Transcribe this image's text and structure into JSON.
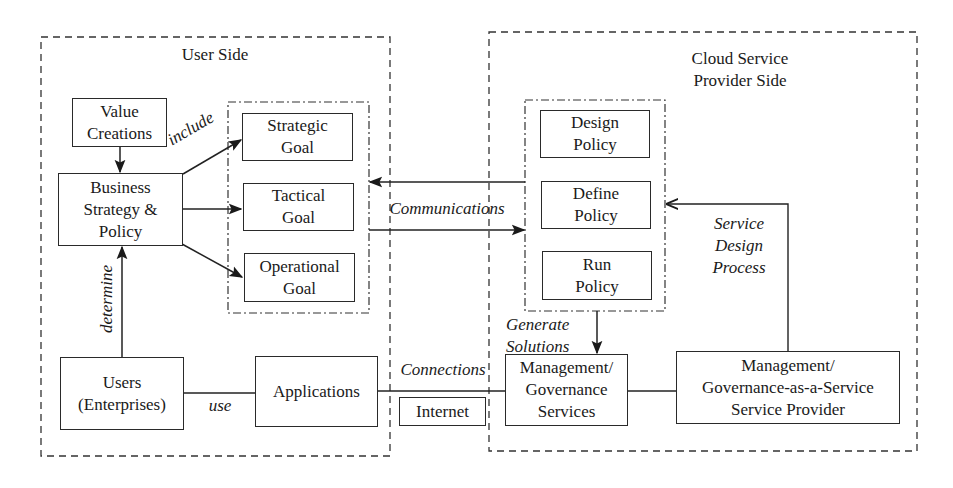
{
  "regions": {
    "user_side": {
      "title": "User Side"
    },
    "cloud_side": {
      "title": "Cloud Service\nProvider Side"
    }
  },
  "nodes": {
    "value_creations": "Value\nCreations",
    "business_strategy": "Business\nStrategy &\nPolicy",
    "strategic_goal": "Strategic\nGoal",
    "tactical_goal": "Tactical\nGoal",
    "operational_goal": "Operational\nGoal",
    "users": "Users\n(Enterprises)",
    "applications": "Applications",
    "internet": "Internet",
    "design_policy": "Design\nPolicy",
    "define_policy": "Define\nPolicy",
    "run_policy": "Run\nPolicy",
    "mgmt_services": "Management/\nGovernance\nServices",
    "mgaas_provider": "Management/\nGovernance-as-a-Service\nService Provider"
  },
  "edge_labels": {
    "include": "include",
    "determine": "determine",
    "use": "use",
    "communications": "Communications",
    "connections": "Connections",
    "generate_solutions": "Generate\nSolutions",
    "service_design_process": "Service\nDesign\nProcess"
  },
  "colors": {
    "line": "#2a2a2a",
    "background": "#ffffff"
  }
}
